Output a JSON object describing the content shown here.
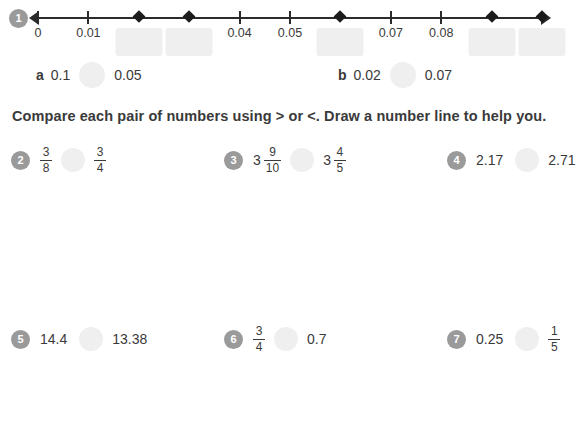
{
  "colors": {
    "badge": "#9a9a9a",
    "blank": "#efefef",
    "ink": "#3a3a3a",
    "axis": "#2b2b2b"
  },
  "numberline": {
    "badge": "1",
    "ticks": [
      {
        "label": "0",
        "marker": "tick",
        "blank": false,
        "pos": 0
      },
      {
        "label": "0.01",
        "marker": "tick",
        "blank": false,
        "pos": 10
      },
      {
        "label": "",
        "marker": "diamond",
        "blank": true,
        "pos": 20
      },
      {
        "label": "",
        "marker": "diamond",
        "blank": true,
        "pos": 30
      },
      {
        "label": "0.04",
        "marker": "tick",
        "blank": false,
        "pos": 40
      },
      {
        "label": "0.05",
        "marker": "tick",
        "blank": false,
        "pos": 50
      },
      {
        "label": "",
        "marker": "diamond",
        "blank": true,
        "pos": 60
      },
      {
        "label": "0.07",
        "marker": "tick",
        "blank": false,
        "pos": 70
      },
      {
        "label": "0.08",
        "marker": "tick",
        "blank": false,
        "pos": 80
      },
      {
        "label": "",
        "marker": "diamond",
        "blank": true,
        "pos": 90
      },
      {
        "label": "",
        "marker": "diamond",
        "blank": true,
        "pos": 100
      }
    ]
  },
  "sub_problems": [
    {
      "letter": "a",
      "left": "0.1",
      "right": "0.05"
    },
    {
      "letter": "b",
      "left": "0.02",
      "right": "0.07"
    }
  ],
  "instruction": "Compare each pair of numbers using > or <. Draw a number line to help you.",
  "problems": [
    {
      "number": "2",
      "left": {
        "whole": "",
        "type": "fraction",
        "num": "3",
        "den": "8"
      },
      "right": {
        "whole": "",
        "type": "fraction",
        "num": "3",
        "den": "4"
      }
    },
    {
      "number": "3",
      "left": {
        "whole": "3",
        "type": "fraction",
        "num": "9",
        "den": "10"
      },
      "right": {
        "whole": "3",
        "type": "fraction",
        "num": "4",
        "den": "5"
      }
    },
    {
      "number": "4",
      "left": {
        "whole": "2.17",
        "type": "decimal",
        "num": "",
        "den": ""
      },
      "right": {
        "whole": "2.71",
        "type": "decimal",
        "num": "",
        "den": ""
      }
    },
    {
      "number": "5",
      "left": {
        "whole": "14.4",
        "type": "decimal",
        "num": "",
        "den": ""
      },
      "right": {
        "whole": "13.38",
        "type": "decimal",
        "num": "",
        "den": ""
      }
    },
    {
      "number": "6",
      "left": {
        "whole": "",
        "type": "fraction",
        "num": "3",
        "den": "4"
      },
      "right": {
        "whole": "0.7",
        "type": "decimal",
        "num": "",
        "den": ""
      }
    },
    {
      "number": "7",
      "left": {
        "whole": "0.25",
        "type": "decimal",
        "num": "",
        "den": ""
      },
      "right": {
        "whole": "",
        "type": "fraction",
        "num": "1",
        "den": "5"
      }
    }
  ]
}
